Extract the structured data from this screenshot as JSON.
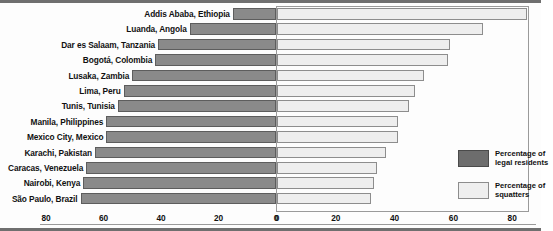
{
  "chart_data": {
    "type": "bar",
    "orientation": "horizontal-diverging",
    "title": "",
    "subtitle": "",
    "xlabel": "",
    "ylabel": "",
    "grid": false,
    "legend_position": "inside-right",
    "left_axis": {
      "label": "",
      "ticks": [
        80,
        60,
        40,
        20,
        0
      ],
      "range": [
        80,
        0
      ],
      "direction": "right-to-left"
    },
    "right_axis": {
      "label": "",
      "ticks": [
        0,
        20,
        40,
        60,
        80
      ],
      "range": [
        0,
        80
      ],
      "direction": "left-to-right"
    },
    "categories": [
      "Addis Ababa, Ethiopia",
      "Luanda, Angola",
      "Dar es Salaam, Tanzania",
      "Bogotá, Colombia",
      "Lusaka, Zambia",
      "Lima, Peru",
      "Tunis, Tunisia",
      "Manila, Philippines",
      "Mexico City, Mexico",
      "Karachi, Pakistan",
      "Caracas, Venezuela",
      "Nairobi, Kenya",
      "São Paulo, Brazil"
    ],
    "series": [
      {
        "name": "Percentage of legal residents",
        "color": "#8a8a8a",
        "values": [
          15,
          30,
          41,
          42,
          50,
          53,
          55,
          59,
          59,
          63,
          66,
          67,
          68
        ]
      },
      {
        "name": "Percentage of squatters",
        "color": "#eeeeee",
        "values": [
          85,
          70,
          59,
          58,
          50,
          47,
          45,
          41,
          41,
          37,
          34,
          33,
          32
        ]
      }
    ],
    "legend": [
      {
        "label_line1": "Percentage of",
        "label_line2": "legal residents",
        "swatch": "dark"
      },
      {
        "label_line1": "Percentage of",
        "label_line2": "squatters",
        "swatch": "light"
      }
    ]
  }
}
